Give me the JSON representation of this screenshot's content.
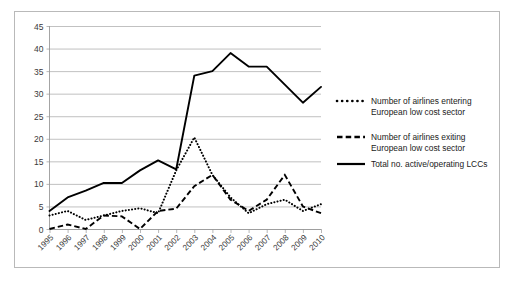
{
  "chart_data": {
    "type": "line",
    "title": "",
    "xlabel": "",
    "ylabel": "",
    "x": [
      "1995",
      "1996",
      "1997",
      "1998",
      "1999",
      "2000",
      "2001",
      "2002",
      "2003",
      "2004",
      "2005",
      "2006",
      "2007",
      "2008",
      "2009",
      "2010"
    ],
    "categories": [
      "1995",
      "1996",
      "1997",
      "1998",
      "1999",
      "2000",
      "2001",
      "2002",
      "2003",
      "2004",
      "2005",
      "2006",
      "2007",
      "2008",
      "2009",
      "2010"
    ],
    "xlim": [
      1995,
      2010
    ],
    "ylim": [
      0,
      45
    ],
    "yticks": [
      0,
      5,
      10,
      15,
      20,
      25,
      30,
      35,
      40,
      45
    ],
    "grid": true,
    "legend_position": "right",
    "series": [
      {
        "name": "Number of  airlines entering European low cost sector",
        "style": "dotted",
        "color": "#000000",
        "values": [
          3,
          4,
          2,
          3,
          4,
          4.6,
          3.5,
          13,
          20.3,
          12,
          7,
          3.5,
          5.5,
          6.5,
          4,
          5.5
        ]
      },
      {
        "name": "Number of airlines exiting European low cost sector",
        "style": "dashed",
        "color": "#000000",
        "values": [
          0,
          1,
          0,
          3,
          2.8,
          0,
          4,
          4.5,
          9.5,
          12,
          6.5,
          4,
          6.5,
          12,
          5,
          3.5
        ]
      },
      {
        "name": "Total no. active/operating LCCs",
        "style": "solid",
        "color": "#000000",
        "values": [
          4,
          7,
          8.5,
          10.2,
          10.2,
          13,
          15.2,
          13.2,
          34,
          35,
          39,
          36,
          36,
          32,
          28,
          31.5
        ]
      }
    ]
  },
  "legend": {
    "items": [
      {
        "style": "dotted",
        "line1": "Number of  airlines entering",
        "line2": "European low cost sector"
      },
      {
        "style": "dashed",
        "line1": "Number of airlines exiting",
        "line2": "European low cost sector"
      },
      {
        "style": "solid",
        "line1": "Total no. active/operating LCCs",
        "line2": ""
      }
    ]
  },
  "axis": {
    "y_labels": [
      "45",
      "40",
      "35",
      "30",
      "25",
      "20",
      "15",
      "10",
      "5",
      "0"
    ],
    "x_labels": [
      "1995",
      "1996",
      "1997",
      "1998",
      "1999",
      "2000",
      "2001",
      "2002",
      "2003",
      "2004",
      "2005",
      "2006",
      "2007",
      "2008",
      "2009",
      "2010"
    ]
  },
  "colors": {
    "series": "#000000",
    "grid": "#a6a6a6",
    "axis": "#9a9a9a",
    "frame": "#b9b9b9",
    "text": "#3a3a3a",
    "background": "#ffffff"
  }
}
